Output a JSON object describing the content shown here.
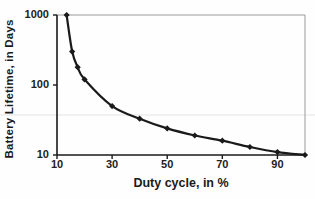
{
  "figure": {
    "background": "#fefefe",
    "axis_color": "#1a1a1a",
    "box_border_color": "#9a9a9a",
    "artifact_line_color": "#e4e4e2"
  },
  "chart_data": {
    "type": "line",
    "title": "",
    "xlabel": "Duty cycle, in %",
    "ylabel": "Battery Lifetime, in Days",
    "x": [
      13.5,
      15.5,
      17.5,
      20,
      30,
      40,
      50,
      60,
      70,
      80,
      90,
      100
    ],
    "y": [
      1000,
      300,
      180,
      120,
      50,
      33,
      24,
      19,
      16,
      13,
      11,
      10
    ],
    "x_ticks": [
      10,
      30,
      50,
      70,
      90
    ],
    "y_ticks": [
      10,
      100,
      1000
    ],
    "xlim": [
      10,
      100
    ],
    "ylim": [
      10,
      1000
    ],
    "x_scale": "linear",
    "y_scale": "log",
    "line_color": "#1a1a1a",
    "marker": "diamond",
    "marker_color": "#1a1a1a",
    "grid": "off",
    "legend": "none"
  }
}
